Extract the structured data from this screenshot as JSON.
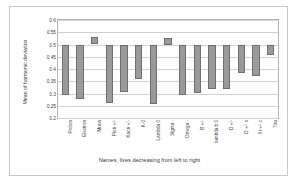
{
  "chart_data": {
    "type": "bar",
    "title": "",
    "xlabel": "Names, lives decreasing from left to right",
    "ylabel": "Mean of harmonic deviation",
    "ylim": [
      0.2,
      0.6
    ],
    "yticks": [
      "0.6",
      "0.55",
      "0.5",
      "0.45",
      "0.4",
      "0.35",
      "0.3",
      "0.25",
      "0.2"
    ],
    "ytick_values": [
      0.6,
      0.55,
      0.5,
      0.45,
      0.4,
      0.35,
      0.3,
      0.25,
      0.2
    ],
    "grid": true,
    "legend": "none",
    "bar_style": "floating range bars (each bar spans a low and a high value)",
    "categories": [
      "Proton",
      "Electron",
      "Muon",
      "Pion +/-",
      "Kaon +/-",
      "K-0",
      "Lambda 0",
      "Sigma -",
      "Omega -",
      "B +/-",
      "lambda b 0",
      "D +/-",
      "D +/- s",
      "Xi +/- c",
      "Tau"
    ],
    "bar_low": [
      0.294,
      0.276,
      0.5,
      0.262,
      0.307,
      0.358,
      0.256,
      0.5,
      0.294,
      0.302,
      0.318,
      0.318,
      0.383,
      0.37,
      0.457
    ],
    "bar_high": [
      0.5,
      0.5,
      0.53,
      0.5,
      0.5,
      0.5,
      0.5,
      0.525,
      0.5,
      0.5,
      0.5,
      0.5,
      0.5,
      0.5,
      0.5
    ],
    "values": [
      0.294,
      0.276,
      0.53,
      0.262,
      0.307,
      0.358,
      0.256,
      0.525,
      0.294,
      0.302,
      0.318,
      0.318,
      0.383,
      0.37,
      0.457
    ]
  },
  "colors": {
    "bar_fill": "#9a9a9a",
    "bar_border": "#6f6f6f",
    "grid": "#d2d2d2",
    "frame": "#b5b5b5",
    "card_border": "#c8c8c8",
    "text": "#3a3a3a",
    "background": "#ffffff"
  }
}
